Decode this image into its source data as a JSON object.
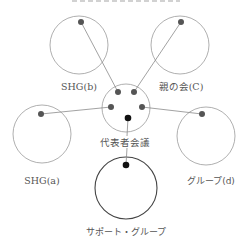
{
  "diagram": {
    "colors": {
      "circle_stroke": "#9a9a9a",
      "main_circle_stroke": "#444444",
      "line": "#8a8a8a",
      "dot": "#555555",
      "key_dot": "#111111",
      "label": "#555555"
    },
    "nodes": [
      {
        "id": "shg_b",
        "label": "SHG(b)",
        "cx": 79,
        "cy": 45,
        "r": 29,
        "dot": [
          81,
          22
        ],
        "label_pos": [
          79,
          86
        ]
      },
      {
        "id": "parents",
        "label": "親の会(C)",
        "cx": 180,
        "cy": 45,
        "r": 29,
        "dot": [
          181,
          22
        ],
        "label_pos": [
          181,
          86
        ]
      },
      {
        "id": "council",
        "label": "代表者会議",
        "cx": 126,
        "cy": 108,
        "r": 24,
        "label_pos": [
          125,
          142
        ]
      },
      {
        "id": "shg_a",
        "label": "SHG(a)",
        "cx": 42,
        "cy": 134,
        "r": 29,
        "dot": [
          41,
          114
        ],
        "label_pos": [
          42,
          180
        ]
      },
      {
        "id": "group_d",
        "label": "グループ(d)",
        "cx": 206,
        "cy": 136,
        "r": 29,
        "dot": [
          202,
          114
        ],
        "label_pos": [
          211,
          180
        ]
      },
      {
        "id": "support",
        "label": "サポート・グループ",
        "cx": 126,
        "cy": 188,
        "r": 31,
        "dot": [
          126,
          165
        ],
        "label_pos": [
          126,
          231
        ]
      }
    ],
    "council_dots": [
      [
        118,
        92
      ],
      [
        134,
        92
      ],
      [
        111,
        107
      ],
      [
        142,
        107
      ]
    ],
    "council_key_dot": [
      128,
      118
    ],
    "edges": [
      {
        "from": "shg_b",
        "to": "council",
        "x1": 81,
        "y1": 22,
        "x2": 118,
        "y2": 92
      },
      {
        "from": "parents",
        "to": "council",
        "x1": 181,
        "y1": 22,
        "x2": 134,
        "y2": 92
      },
      {
        "from": "shg_a",
        "to": "council",
        "x1": 41,
        "y1": 114,
        "x2": 111,
        "y2": 107
      },
      {
        "from": "group_d",
        "to": "council",
        "x1": 202,
        "y1": 114,
        "x2": 142,
        "y2": 107
      },
      {
        "from": "council",
        "to": "support",
        "x1": 128,
        "y1": 118,
        "x2": 126,
        "y2": 165
      }
    ]
  },
  "labels": {
    "shg_b": "SHG(b)",
    "parents": "親の会(C)",
    "council": "代表者会議",
    "shg_a": "SHG(a)",
    "group_d": "グループ(d)",
    "support": "サポート・グループ"
  }
}
